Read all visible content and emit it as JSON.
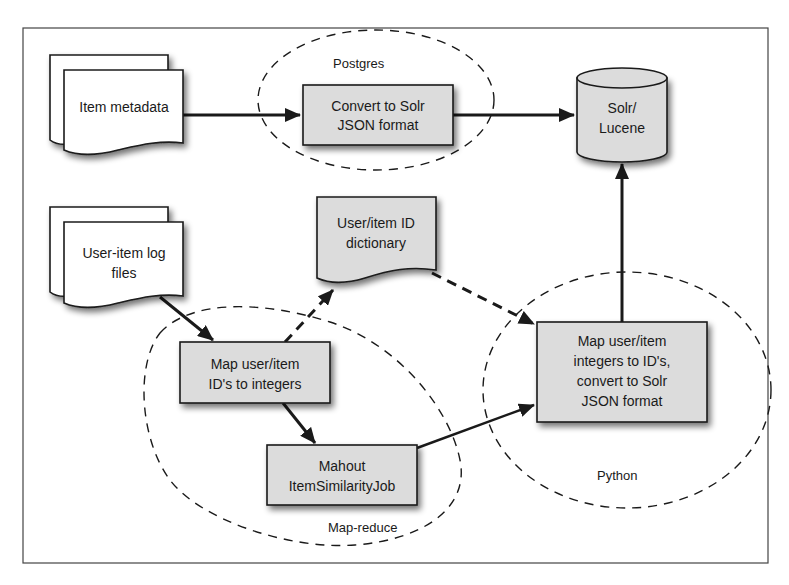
{
  "diagram": {
    "type": "data-flow",
    "colors": {
      "frame": "#444444",
      "box_fill": "#dcdcdc",
      "doc_fill": "#ffffff",
      "stroke": "#1a1a1a",
      "background": "#ffffff"
    },
    "groups": {
      "postgres": {
        "label": "Postgres"
      },
      "map_reduce": {
        "label": "Map-reduce"
      },
      "python": {
        "label": "Python"
      }
    },
    "nodes": {
      "item_metadata": {
        "kind": "document-stack",
        "line1": "Item metadata"
      },
      "convert_solr": {
        "kind": "process",
        "line1": "Convert to Solr",
        "line2": "JSON format",
        "group": "Postgres"
      },
      "solr_lucene": {
        "kind": "database",
        "line1": "Solr/",
        "line2": "Lucene"
      },
      "user_item_logs": {
        "kind": "document-stack",
        "line1": "User-item log",
        "line2": "files"
      },
      "id_dictionary": {
        "kind": "document",
        "line1": "User/item ID",
        "line2": "dictionary"
      },
      "map_ids": {
        "kind": "process",
        "line1": "Map user/item",
        "line2": "ID's to integers",
        "group": "Map-reduce"
      },
      "mahout": {
        "kind": "process",
        "line1": "Mahout",
        "line2": "ItemSimilarityJob",
        "group": "Map-reduce"
      },
      "map_back": {
        "kind": "process",
        "line1": "Map user/item",
        "line2": "integers to ID's,",
        "line3": "convert to Solr",
        "line4": "JSON format",
        "group": "Python"
      }
    },
    "edges": [
      {
        "from": "Item metadata",
        "to": "Convert to Solr JSON format",
        "style": "solid"
      },
      {
        "from": "Convert to Solr JSON format",
        "to": "Solr/Lucene",
        "style": "solid"
      },
      {
        "from": "User-item log files",
        "to": "Map user/item ID's to integers",
        "style": "solid"
      },
      {
        "from": "Map user/item ID's to integers",
        "to": "User/item ID dictionary",
        "style": "dashed"
      },
      {
        "from": "Map user/item ID's to integers",
        "to": "Mahout ItemSimilarityJob",
        "style": "solid"
      },
      {
        "from": "User/item ID dictionary",
        "to": "Map user/item integers to ID's, convert to Solr JSON format",
        "style": "dashed"
      },
      {
        "from": "Mahout ItemSimilarityJob",
        "to": "Map user/item integers to ID's, convert to Solr JSON format",
        "style": "solid"
      },
      {
        "from": "Map user/item integers to ID's, convert to Solr JSON format",
        "to": "Solr/Lucene",
        "style": "solid"
      }
    ]
  }
}
